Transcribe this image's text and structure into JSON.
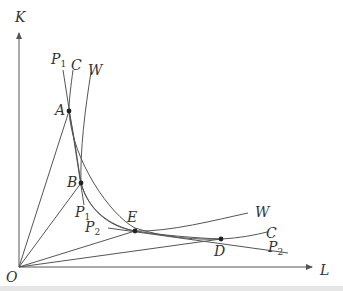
{
  "diagram": {
    "axes": {
      "y_label": "K",
      "x_label": "L",
      "origin_label": "O"
    },
    "points": [
      {
        "id": "A",
        "label": "A"
      },
      {
        "id": "B",
        "label": "B"
      },
      {
        "id": "E",
        "label": "E"
      },
      {
        "id": "D",
        "label": "D"
      }
    ],
    "curves": [
      {
        "id": "P1",
        "label": "P",
        "sub": "1",
        "description": "line through A and B"
      },
      {
        "id": "C",
        "label": "C",
        "description": "convex curve through A, E, D"
      },
      {
        "id": "W",
        "label": "W",
        "description": "curve through B, E rising to the right"
      },
      {
        "id": "P2",
        "label": "P",
        "sub": "2",
        "description": "line through E and D"
      }
    ],
    "rays_from_origin": [
      "OA",
      "OB",
      "OE",
      "OD"
    ],
    "colors": {
      "line": "#555555",
      "text": "#333333",
      "point": "#222222"
    }
  }
}
